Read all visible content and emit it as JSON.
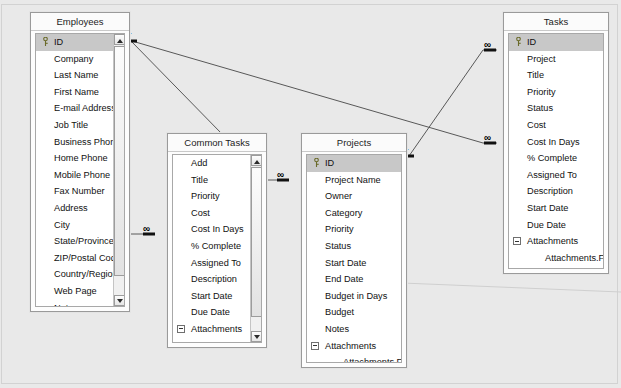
{
  "window": {
    "title": "Relationships",
    "background_color": "#e9e9e9"
  },
  "tables": [
    {
      "id": "employees",
      "title": "Employees",
      "scrolled": true,
      "fields": [
        {
          "label": "ID",
          "kind": "pk"
        },
        {
          "label": "Company",
          "kind": "field"
        },
        {
          "label": "Last Name",
          "kind": "field"
        },
        {
          "label": "First Name",
          "kind": "field"
        },
        {
          "label": "E-mail Address",
          "kind": "field"
        },
        {
          "label": "Job Title",
          "kind": "field"
        },
        {
          "label": "Business Phone",
          "kind": "field"
        },
        {
          "label": "Home Phone",
          "kind": "field"
        },
        {
          "label": "Mobile Phone",
          "kind": "field"
        },
        {
          "label": "Fax Number",
          "kind": "field"
        },
        {
          "label": "Address",
          "kind": "field"
        },
        {
          "label": "City",
          "kind": "field"
        },
        {
          "label": "State/Province",
          "kind": "field"
        },
        {
          "label": "ZIP/Postal Code",
          "kind": "field"
        },
        {
          "label": "Country/Region",
          "kind": "field"
        },
        {
          "label": "Web Page",
          "kind": "field"
        },
        {
          "label": "Notes",
          "kind": "field"
        },
        {
          "label": "Attachments",
          "kind": "group"
        },
        {
          "label": "Attachments.FileData",
          "kind": "sub"
        },
        {
          "label": "Attachments.FileName",
          "kind": "sub"
        },
        {
          "label": "Attachments.FileType",
          "kind": "sub"
        }
      ]
    },
    {
      "id": "common-tasks",
      "title": "Common Tasks",
      "scrolled": true,
      "fields": [
        {
          "label": "Add",
          "kind": "field"
        },
        {
          "label": "Title",
          "kind": "field"
        },
        {
          "label": "Priority",
          "kind": "field"
        },
        {
          "label": "Cost",
          "kind": "field"
        },
        {
          "label": "Cost In Days",
          "kind": "field"
        },
        {
          "label": "% Complete",
          "kind": "field"
        },
        {
          "label": "Assigned To",
          "kind": "field"
        },
        {
          "label": "Description",
          "kind": "field"
        },
        {
          "label": "Start Date",
          "kind": "field"
        },
        {
          "label": "Due Date",
          "kind": "field"
        },
        {
          "label": "Attachments",
          "kind": "group"
        },
        {
          "label": "Attachments.FileData",
          "kind": "sub"
        },
        {
          "label": "Attachments.FileName",
          "kind": "sub"
        }
      ]
    },
    {
      "id": "projects",
      "title": "Projects",
      "scrolled": false,
      "fields": [
        {
          "label": "ID",
          "kind": "pk"
        },
        {
          "label": "Project Name",
          "kind": "field"
        },
        {
          "label": "Owner",
          "kind": "field"
        },
        {
          "label": "Category",
          "kind": "field"
        },
        {
          "label": "Priority",
          "kind": "field"
        },
        {
          "label": "Status",
          "kind": "field"
        },
        {
          "label": "Start Date",
          "kind": "field"
        },
        {
          "label": "End Date",
          "kind": "field"
        },
        {
          "label": "Budget in Days",
          "kind": "field"
        },
        {
          "label": "Budget",
          "kind": "field"
        },
        {
          "label": "Notes",
          "kind": "field"
        },
        {
          "label": "Attachments",
          "kind": "group"
        },
        {
          "label": "Attachments.FileData",
          "kind": "sub"
        },
        {
          "label": "Attachments.FileName",
          "kind": "sub"
        },
        {
          "label": "Attachments.FileType",
          "kind": "sub"
        }
      ]
    },
    {
      "id": "tasks",
      "title": "Tasks",
      "scrolled": false,
      "fields": [
        {
          "label": "ID",
          "kind": "pk"
        },
        {
          "label": "Project",
          "kind": "field"
        },
        {
          "label": "Title",
          "kind": "field"
        },
        {
          "label": "Priority",
          "kind": "field"
        },
        {
          "label": "Status",
          "kind": "field"
        },
        {
          "label": "Cost",
          "kind": "field"
        },
        {
          "label": "Cost In Days",
          "kind": "field"
        },
        {
          "label": "% Complete",
          "kind": "field"
        },
        {
          "label": "Assigned To",
          "kind": "field"
        },
        {
          "label": "Description",
          "kind": "field"
        },
        {
          "label": "Start Date",
          "kind": "field"
        },
        {
          "label": "Due Date",
          "kind": "field"
        },
        {
          "label": "Attachments",
          "kind": "group"
        },
        {
          "label": "Attachments.FileData",
          "kind": "sub"
        },
        {
          "label": "Attachments.FileName",
          "kind": "sub"
        },
        {
          "label": "Attachments.FileType",
          "kind": "sub"
        }
      ]
    }
  ],
  "relationships": [
    {
      "id": "emp-commontasks-assigned",
      "one_label": "1",
      "many_label": "∞"
    },
    {
      "id": "emp-commontasks-owner",
      "one_label": "1",
      "many_label": "∞"
    },
    {
      "id": "emp-tasks-assigned",
      "one_label": "1",
      "many_label": "∞"
    },
    {
      "id": "projects-tasks",
      "one_label": "1",
      "many_label": "∞"
    }
  ],
  "markers": {
    "one": "1",
    "many": "∞"
  }
}
